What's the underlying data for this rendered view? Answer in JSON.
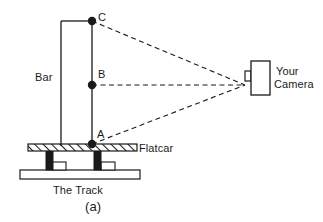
{
  "figure": {
    "caption": "(a)",
    "labels": {
      "bar": "Bar",
      "flatcar": "Flatcar",
      "track": "The Track",
      "camera_line1": "Your",
      "camera_line2": "Camera"
    },
    "points": [
      {
        "id": "C",
        "label": "C",
        "x": 92,
        "y": 21
      },
      {
        "id": "B",
        "label": "B",
        "x": 92,
        "y": 85
      },
      {
        "id": "A",
        "label": "A",
        "x": 92,
        "y": 144
      }
    ],
    "sight_lines": [
      {
        "from": "C",
        "to": "camera-lens"
      },
      {
        "from": "B",
        "to": "camera-lens"
      },
      {
        "from": "A",
        "to": "camera-lens"
      }
    ],
    "colors": {
      "stroke": "#1a1a1a",
      "fill_white": "#ffffff",
      "fill_black": "#1a1a1a",
      "background": "#ffffff"
    }
  }
}
